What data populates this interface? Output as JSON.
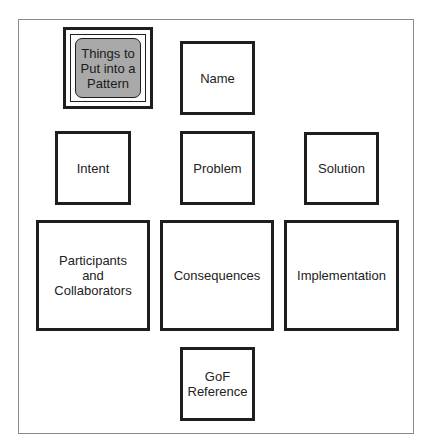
{
  "diagram": {
    "title_box": {
      "label": "Things to\nPut into a\nPattern",
      "fill": "#a9a9a9"
    },
    "boxes": [
      {
        "id": "name",
        "label": "Name"
      },
      {
        "id": "intent",
        "label": "Intent"
      },
      {
        "id": "problem",
        "label": "Problem"
      },
      {
        "id": "solution",
        "label": "Solution"
      },
      {
        "id": "participants",
        "label": "Participants\nand\nCollaborators"
      },
      {
        "id": "consequences",
        "label": "Consequences"
      },
      {
        "id": "implementation",
        "label": "Implementation"
      },
      {
        "id": "gof",
        "label": "GoF\nReference"
      }
    ]
  }
}
